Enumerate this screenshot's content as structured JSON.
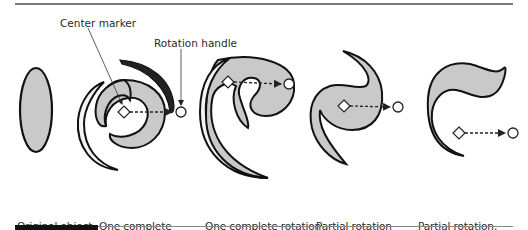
{
  "figure": {
    "callouts": {
      "center_marker": "Center marker",
      "rotation_handle": "Rotation handle"
    },
    "panels": [
      {
        "id": "original",
        "label_line1": "Original object",
        "label_line2": "",
        "icon": "ellipse-shape"
      },
      {
        "id": "one-complete",
        "label_line1": "One complete",
        "label_line2": "rotation",
        "icon": "spiral-shape"
      },
      {
        "id": "one-complete-offset",
        "label_line1": "One complete rotation",
        "label_line2": "using center offset",
        "icon": "spiral-offset-shape"
      },
      {
        "id": "partial",
        "label_line1": "Partial rotation",
        "label_line2": "",
        "icon": "partial-twist-shape"
      },
      {
        "id": "partial-offset",
        "label_line1": "Partial rotation,",
        "label_line2": "using center offset",
        "icon": "partial-twist-offset-shape"
      }
    ],
    "colors": {
      "fill": "#c9c9c9",
      "stroke": "#111111",
      "rule": "#7a7a7a",
      "bar": "#111111"
    }
  }
}
